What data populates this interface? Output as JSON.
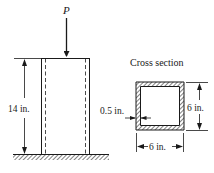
{
  "load": {
    "label": "P"
  },
  "column": {
    "height_label": "14 in."
  },
  "cross_section": {
    "title": "Cross section",
    "wall_thickness_label": "0.5 in.",
    "height_label": "6 in.",
    "width_label": "6 in."
  },
  "colors": {
    "ink": "#1a1a1a",
    "background": "#ffffff"
  }
}
